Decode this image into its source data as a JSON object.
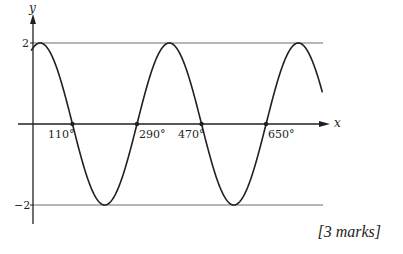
{
  "chart_data": {
    "type": "line",
    "title": "",
    "xlabel": "x",
    "ylabel": "y",
    "function": "y = 2cos(x - 20°)",
    "amplitude": 2,
    "period_deg": 360,
    "phase_shift_deg": 20,
    "x_range_deg": [
      -5,
      808
    ],
    "ylim": [
      -2,
      2
    ],
    "y_ticks": [
      {
        "value": 2,
        "label": "2"
      },
      {
        "value": -2,
        "label": "−2"
      }
    ],
    "x_intercepts": [
      {
        "value": 110,
        "label": "110°"
      },
      {
        "value": 290,
        "label": "290°"
      },
      {
        "value": 470,
        "label": "470°"
      },
      {
        "value": 650,
        "label": "650°"
      }
    ],
    "maxima": [
      {
        "x": 20,
        "y": 2
      },
      {
        "x": 380,
        "y": 2
      },
      {
        "x": 740,
        "y": 2
      }
    ],
    "minima": [
      {
        "x": 200,
        "y": -2
      },
      {
        "x": 560,
        "y": -2
      }
    ],
    "reference_lines": [
      {
        "y": 2
      },
      {
        "y": -2
      }
    ],
    "grid": false,
    "legend": null
  },
  "labels": {
    "y_axis": "y",
    "x_axis": "x",
    "y_top": "2",
    "y_bottom": "−2",
    "x0": "110°",
    "x1": "290°",
    "x2": "470°",
    "x3": "650°"
  },
  "footer": {
    "marks": "[3 marks]"
  },
  "colors": {
    "ink": "#231f20",
    "ref_line": "#6d6e71"
  }
}
